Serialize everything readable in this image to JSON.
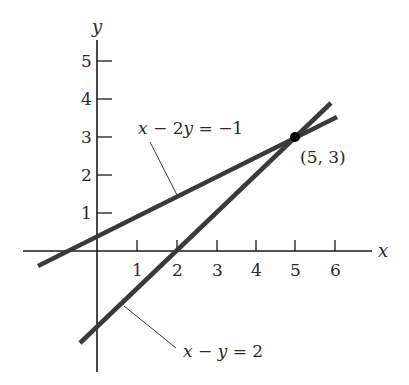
{
  "figure": {
    "axes": {
      "x_label": "x",
      "y_label": "y",
      "x_ticks": [
        "1",
        "2",
        "3",
        "4",
        "5",
        "6"
      ],
      "y_ticks": [
        "1",
        "2",
        "3",
        "4",
        "5"
      ]
    },
    "lines": [
      {
        "name": "line-1",
        "equation": "x − 2y = −1",
        "label_parts": [
          "x",
          " − 2",
          "y",
          " = −1"
        ]
      },
      {
        "name": "line-2",
        "equation": "x − y = 2",
        "label_parts": [
          "x",
          " − ",
          "y",
          " = 2"
        ]
      }
    ],
    "intersection": {
      "label": "(5, 3)",
      "x": 5,
      "y": 3
    },
    "colors": {
      "line": "#3a3a3a",
      "axis": "#1a1a1a",
      "background": "#ffffff"
    }
  }
}
